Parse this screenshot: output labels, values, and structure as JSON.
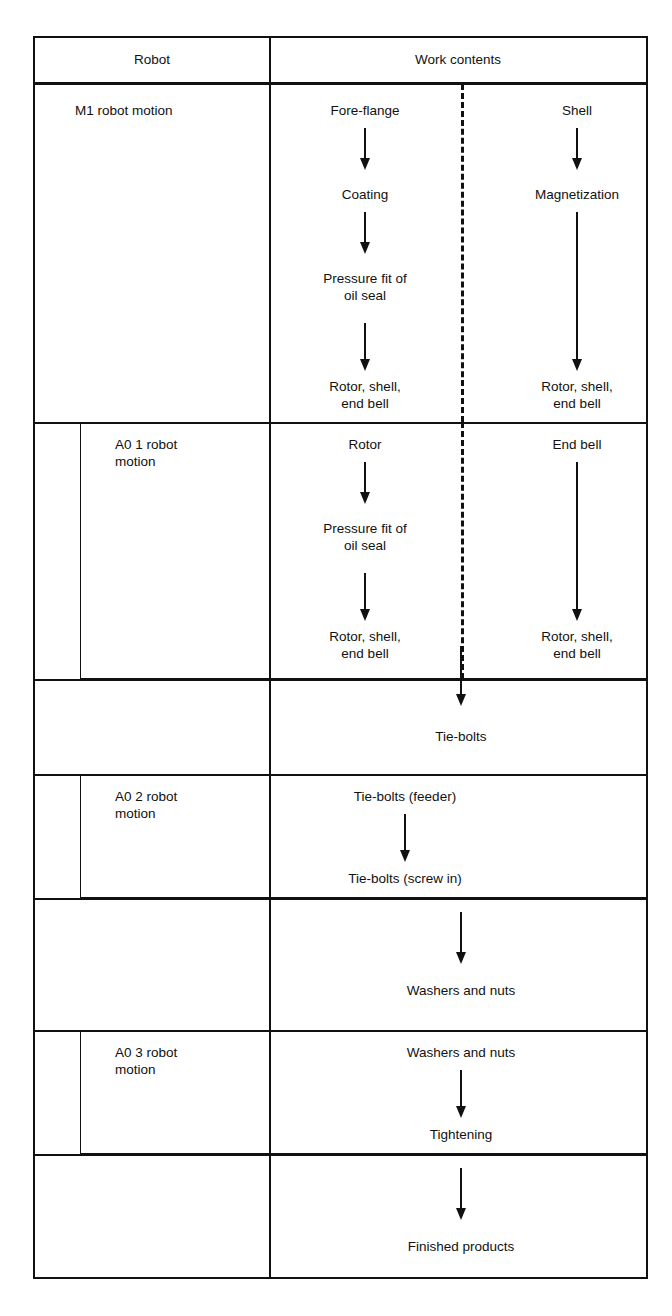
{
  "figure": {
    "caption": "",
    "colors": {
      "line": "#111111",
      "background": "#ffffff"
    }
  },
  "table": {
    "headers": {
      "robot": "Robot",
      "work_contents": "Work contents"
    },
    "rows": [
      {
        "id": "m1",
        "robot_label": "M1 robot motion",
        "boxed": false,
        "left_branch": [
          "Fore-flange",
          "Coating",
          "Pressure fit of\noil seal",
          "Rotor, shell,\nend bell"
        ],
        "right_branch": [
          "Shell",
          "Magnetization",
          "Rotor, shell,\nend bell"
        ]
      },
      {
        "id": "a01",
        "robot_label": "A0 1 robot\nmotion",
        "boxed": true,
        "left_branch": [
          "Rotor",
          "Pressure fit of\noil seal",
          "Rotor, shell,\nend bell"
        ],
        "right_branch": [
          "End bell",
          "Rotor, shell,\nend bell"
        ]
      },
      {
        "id": "tiebolts",
        "robot_label": "",
        "boxed": false,
        "center_branch": [
          "Tie-bolts"
        ]
      },
      {
        "id": "a02",
        "robot_label": "A0 2 robot\nmotion",
        "boxed": true,
        "center_branch": [
          "Tie-bolts (feeder)",
          "Tie-bolts (screw in)"
        ]
      },
      {
        "id": "washers",
        "robot_label": "",
        "boxed": false,
        "center_branch": [
          "Washers and nuts"
        ]
      },
      {
        "id": "a03",
        "robot_label": "A0 3 robot\nmotion",
        "boxed": true,
        "center_branch": [
          "Washers and nuts",
          "Tightening"
        ]
      },
      {
        "id": "finished",
        "robot_label": "",
        "boxed": false,
        "center_branch": [
          "Finished products"
        ]
      }
    ]
  },
  "nodes": {
    "m1_robot": "M1 robot motion",
    "m1_fore_flange": "Fore-flange",
    "m1_coating": "Coating",
    "m1_pressure_fit": "Pressure fit of\noil seal",
    "m1_rotor_shell_left": "Rotor, shell,\nend bell",
    "m1_shell": "Shell",
    "m1_magnetization": "Magnetization",
    "m1_rotor_shell_right": "Rotor, shell,\nend bell",
    "a01_robot": "A0 1 robot\nmotion",
    "a01_rotor": "Rotor",
    "a01_pressure_fit": "Pressure fit of\noil seal",
    "a01_rotor_shell_left": "Rotor, shell,\nend bell",
    "a01_end_bell": "End bell",
    "a01_rotor_shell_right": "Rotor, shell,\nend bell",
    "tie_bolts": "Tie-bolts",
    "a02_robot": "A0 2 robot\nmotion",
    "a02_feeder": "Tie-bolts (feeder)",
    "a02_screw_in": "Tie-bolts (screw in)",
    "washers_and_nuts": "Washers and nuts",
    "a03_robot": "A0 3 robot\nmotion",
    "a03_washers": "Washers and nuts",
    "a03_tightening": "Tightening",
    "finished_products": "Finished products"
  },
  "icons": {
    "down_arrow": "down-arrow-icon",
    "dashed_divider": "dashed-divider-icon"
  }
}
